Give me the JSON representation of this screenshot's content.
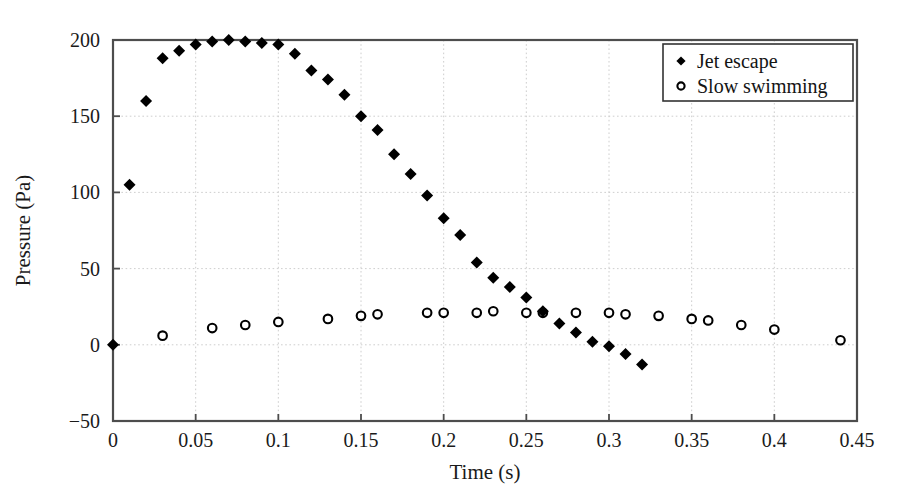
{
  "chart_data": {
    "type": "scatter",
    "title": "",
    "xlabel": "Time (s)",
    "ylabel": "Pressure (Pa)",
    "xlim": [
      0,
      0.45
    ],
    "ylim": [
      -50,
      200
    ],
    "xticks": [
      "0",
      "0.05",
      "0.1",
      "0.15",
      "0.2",
      "0.25",
      "0.3",
      "0.35",
      "0.4",
      "0.45"
    ],
    "xtick_values": [
      0,
      0.05,
      0.1,
      0.15,
      0.2,
      0.25,
      0.3,
      0.35,
      0.4,
      0.45
    ],
    "yticks": [
      "200",
      "150",
      "100",
      "50",
      "0",
      "−50"
    ],
    "ytick_values": [
      200,
      150,
      100,
      50,
      0,
      -50
    ],
    "grid": true,
    "legend_position": "top-right",
    "series": [
      {
        "name": "Jet escape",
        "marker": "filled-diamond",
        "color": "#000000",
        "x": [
          0.0,
          0.01,
          0.02,
          0.03,
          0.04,
          0.05,
          0.06,
          0.07,
          0.08,
          0.09,
          0.1,
          0.11,
          0.12,
          0.13,
          0.14,
          0.15,
          0.16,
          0.17,
          0.18,
          0.19,
          0.2,
          0.21,
          0.22,
          0.23,
          0.24,
          0.25,
          0.26,
          0.27,
          0.28,
          0.29,
          0.3,
          0.31,
          0.32
        ],
        "y": [
          0,
          105,
          160,
          188,
          193,
          197,
          199,
          200,
          199,
          198,
          197,
          191,
          180,
          174,
          164,
          150,
          141,
          125,
          112,
          98,
          83,
          72,
          54,
          44,
          38,
          31,
          22,
          14,
          8,
          2,
          -1,
          -6,
          -13
        ]
      },
      {
        "name": "Slow swimming",
        "marker": "open-circle",
        "color": "#000000",
        "x": [
          0.03,
          0.06,
          0.08,
          0.1,
          0.13,
          0.15,
          0.16,
          0.19,
          0.2,
          0.22,
          0.23,
          0.25,
          0.26,
          0.28,
          0.3,
          0.31,
          0.33,
          0.35,
          0.36,
          0.38,
          0.4,
          0.44
        ],
        "y": [
          6,
          11,
          13,
          15,
          17,
          19,
          20,
          21,
          21,
          21,
          22,
          21,
          21,
          21,
          21,
          20,
          19,
          17,
          16,
          13,
          10,
          3
        ]
      }
    ],
    "legend": [
      {
        "label": "Jet escape",
        "marker": "filled-diamond"
      },
      {
        "label": "Slow swimming",
        "marker": "open-circle"
      }
    ]
  },
  "plot_area": {
    "left": 113,
    "right": 857,
    "top": 40,
    "bottom": 421
  },
  "legend_frame": {
    "left": 663,
    "top": 44,
    "width": 190,
    "height": 57
  }
}
